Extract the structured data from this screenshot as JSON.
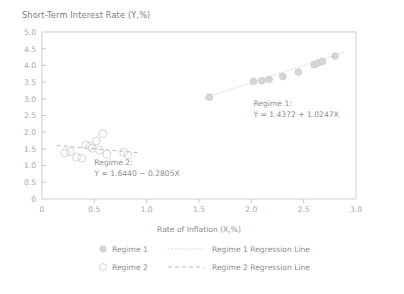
{
  "chart_data": {
    "type": "scatter",
    "title": "Short-Term Interest Rate (Y,%)",
    "xlabel": "Rate of Inflation (X,%)",
    "ylabel": "",
    "xlim": [
      0,
      3.0
    ],
    "ylim": [
      0,
      5.0
    ],
    "xticks": [
      "0",
      "0.5",
      "1.0",
      "1.5",
      "2.0",
      "2.5",
      "3.0"
    ],
    "xtick_values": [
      0,
      0.5,
      1.0,
      1.5,
      2.0,
      2.5,
      3.0
    ],
    "yticks": [
      "0",
      "0.5",
      "1.0",
      "1.5",
      "2.0",
      "2.5",
      "3.0",
      "3.5",
      "4.0",
      "4.5",
      "5.0"
    ],
    "ytick_values": [
      0,
      0.5,
      1.0,
      1.5,
      2.0,
      2.5,
      3.0,
      3.5,
      4.0,
      4.5,
      5.0
    ],
    "grid": false,
    "legend_position": "bottom",
    "series": [
      {
        "name": "Regime 1",
        "marker": "filled-circle",
        "points": [
          {
            "x": 1.6,
            "y": 3.05
          },
          {
            "x": 2.02,
            "y": 3.52
          },
          {
            "x": 2.1,
            "y": 3.54
          },
          {
            "x": 2.17,
            "y": 3.58
          },
          {
            "x": 2.3,
            "y": 3.67
          },
          {
            "x": 2.45,
            "y": 3.8
          },
          {
            "x": 2.6,
            "y": 4.02
          },
          {
            "x": 2.64,
            "y": 4.08
          },
          {
            "x": 2.68,
            "y": 4.12
          },
          {
            "x": 2.8,
            "y": 4.28
          }
        ]
      },
      {
        "name": "Regime 2",
        "marker": "hollow-circle",
        "points": [
          {
            "x": 0.22,
            "y": 1.38
          },
          {
            "x": 0.27,
            "y": 1.42
          },
          {
            "x": 0.33,
            "y": 1.25
          },
          {
            "x": 0.38,
            "y": 1.22
          },
          {
            "x": 0.42,
            "y": 1.62
          },
          {
            "x": 0.46,
            "y": 1.58
          },
          {
            "x": 0.48,
            "y": 1.52
          },
          {
            "x": 0.52,
            "y": 1.74
          },
          {
            "x": 0.55,
            "y": 1.46
          },
          {
            "x": 0.58,
            "y": 1.96
          },
          {
            "x": 0.62,
            "y": 1.34
          },
          {
            "x": 0.78,
            "y": 1.4
          },
          {
            "x": 0.82,
            "y": 1.32
          }
        ]
      }
    ],
    "regression_lines": [
      {
        "name": "Regime 1 Regression Line",
        "intercept": 1.4372,
        "slope": 1.0247,
        "style": "dotted",
        "x_start": 1.55,
        "x_end": 2.88
      },
      {
        "name": "Regime 2 Regression Line",
        "intercept": 1.644,
        "slope": -0.2805,
        "style": "dashed",
        "x_start": 0.14,
        "x_end": 0.92
      }
    ],
    "annotations": [
      {
        "id": "regime1-annotation",
        "line1": "Regime 1:",
        "line2": "Y = 1.4372 + 1.0247X",
        "x": 2.02,
        "y": 2.78
      },
      {
        "id": "regime2-annotation",
        "line1": "Regime 2:",
        "line2": "Y = 1.6440 − 0.2805X",
        "x": 0.5,
        "y": 1.02
      }
    ],
    "legend": [
      {
        "label": "Regime 1",
        "type": "marker",
        "marker": "filled-circle"
      },
      {
        "label": "Regime 1 Regression Line",
        "type": "line",
        "style": "dotted"
      },
      {
        "label": "Regime 2",
        "type": "marker",
        "marker": "hollow-circle"
      },
      {
        "label": "Regime 2 Regression Line",
        "type": "line",
        "style": "dashed"
      }
    ],
    "colors": {
      "marker_fill": "#d6d6d6",
      "marker_stroke": "#cfcfcf",
      "frame": "#c9c9c9",
      "text": "#8e8e8e",
      "reg1_line": "#dcdcdc",
      "reg2_line": "#b9b9b9"
    }
  }
}
